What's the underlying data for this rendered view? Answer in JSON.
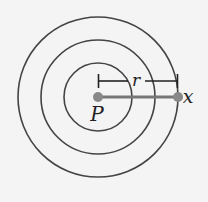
{
  "diagram": {
    "type": "concentric-circles",
    "center_label": "P",
    "point_label": "x",
    "distance_label": "r",
    "colors": {
      "background": "#f4f4f4",
      "circle_stroke": "#444444",
      "point_fill": "#888888",
      "line": "#777777",
      "bracket": "#222222",
      "text": "#222222"
    },
    "circles": [
      {
        "cx": 98,
        "cy": 97,
        "r": 34
      },
      {
        "cx": 98,
        "cy": 97,
        "r": 57
      },
      {
        "cx": 98,
        "cy": 97,
        "r": 80
      }
    ],
    "center_point": {
      "x": 98,
      "y": 97
    },
    "outer_point": {
      "x": 178,
      "y": 97
    }
  }
}
